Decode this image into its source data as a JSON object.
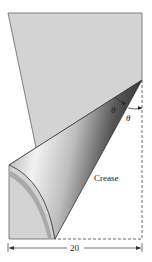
{
  "figure": {
    "labels": {
      "angle_upper": "θ",
      "angle_lower": "θ",
      "crease": "Crease",
      "width": "20"
    },
    "colors": {
      "paper": "#d4d4d4",
      "outline": "#555555",
      "dashed": "#444444",
      "flap_light": "#f4f4f4",
      "flap_dark": "#3a3a3a"
    }
  }
}
